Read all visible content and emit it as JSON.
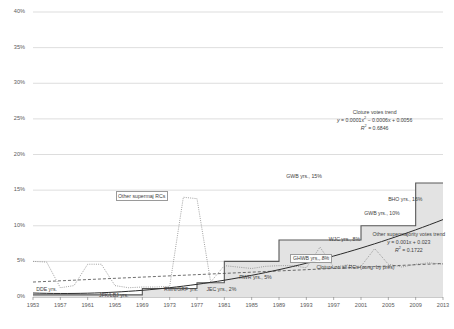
{
  "chart_data": {
    "type": "line",
    "title": "",
    "xlabel": "",
    "ylabel": "",
    "ylim": [
      0,
      0.4
    ],
    "xlim": [
      1953,
      2013
    ],
    "grid": true,
    "legend_position": "inline-annotations",
    "ytick_labels": [
      "40%",
      "35%",
      "30%",
      "25%",
      "20%",
      "15%",
      "10%",
      "5%",
      "0%"
    ],
    "ytick_values": [
      40,
      35,
      30,
      25,
      20,
      15,
      10,
      5,
      0
    ],
    "xtick_labels": [
      "1953",
      "1957",
      "1961",
      "1965",
      "1969",
      "1973",
      "1977",
      "1981",
      "1985",
      "1989",
      "1993",
      "1997",
      "2001",
      "2005",
      "2009",
      "2013"
    ],
    "xtick_values": [
      1953,
      1957,
      1961,
      1965,
      1969,
      1973,
      1977,
      1981,
      1985,
      1989,
      1993,
      1997,
      2001,
      2005,
      2009,
      2013
    ],
    "series": [
      {
        "name": "Cloture on all RCs (cong. by pres)",
        "style": "step-area",
        "color": "#585858",
        "fill": "#e3e3e3",
        "x": [
          1953,
          1961,
          1969,
          1977,
          1981,
          1989,
          1993,
          2001,
          2009,
          2013
        ],
        "values": [
          0.3,
          0.3,
          1.2,
          2.0,
          5.0,
          8.0,
          8.0,
          10.0,
          16.0,
          16.0
        ]
      },
      {
        "name": "Other supermaj RCs",
        "style": "dotted",
        "color": "#7a7a7a",
        "x": [
          1953,
          1955,
          1957,
          1959,
          1961,
          1963,
          1965,
          1967,
          1969,
          1971,
          1973,
          1975,
          1977,
          1979,
          1981,
          1983,
          1985,
          1987,
          1989,
          1991,
          1993,
          1995,
          1997,
          1999,
          2001,
          2003,
          2005,
          2007,
          2009,
          2011,
          2013
        ],
        "values": [
          5.0,
          4.9,
          1.3,
          1.6,
          4.6,
          4.6,
          1.6,
          1.3,
          1.4,
          1.4,
          1.5,
          14.0,
          13.8,
          2.1,
          4.4,
          4.2,
          4.0,
          4.3,
          4.4,
          4.4,
          4.1,
          7.0,
          4.2,
          4.5,
          4.3,
          6.8,
          4.6,
          4.2,
          4.6,
          4.8,
          4.6
        ]
      },
      {
        "name": "Other supermajority votes trend",
        "style": "dashed",
        "color": "#4a4a4a",
        "equation": "y = 0.001x + 0.023",
        "r2": "R² = 0.1722",
        "x": [
          1953,
          2013
        ],
        "values": [
          2.1,
          4.7
        ]
      },
      {
        "name": "Cloture votes trend",
        "style": "solid",
        "color": "#2b2b2b",
        "equation": "y = 0.0001x² − 0.0006x + 0.0056",
        "r2": "R² = 0.6846",
        "x": [
          1953,
          1973,
          1993,
          2013
        ],
        "values": [
          0.4,
          2.6,
          8.8,
          21.0
        ]
      }
    ],
    "annotations": [
      {
        "id": "doe",
        "text": "DDE yrs.",
        "x": 1956.4,
        "y": 1.0,
        "boxed": false
      },
      {
        "id": "jfk-lbj",
        "text": "JFK/LBJ yrs.",
        "x": 1965.6,
        "y": 0.2,
        "boxed": false
      },
      {
        "id": "rmn-grf",
        "text": "RMN/GRF yrs.",
        "x": 1975.1,
        "y": 1.0,
        "boxed": false
      },
      {
        "id": "jec",
        "text": "JEC yrs., 2%",
        "x": 1981.3,
        "y": 1.0,
        "boxed": false
      },
      {
        "id": "rwr",
        "text": "RWR yrs., 5%",
        "x": 1986.1,
        "y": 2.6,
        "boxed": false
      },
      {
        "id": "ghwb",
        "text": "GHWB yrs., 8%",
        "x": 1993.6,
        "y": 5.5,
        "boxed": true
      },
      {
        "id": "wjc",
        "text": "WJC yrs., 8%",
        "x": 1999.2,
        "y": 8.0,
        "boxed": false
      },
      {
        "id": "gwb-low",
        "text": "GWB yrs., 10%",
        "x": 2004.4,
        "y": 11.7,
        "boxed": false
      },
      {
        "id": "bho",
        "text": "BHO yrs., 16%",
        "x": 2007.9,
        "y": 13.6,
        "boxed": false
      },
      {
        "id": "gwb-high",
        "text": "GWB yrs., 15%",
        "x": 1993.0,
        "y": 16.9,
        "boxed": false
      },
      {
        "id": "other-supermaj-rcs",
        "text": "Other supermaj RCs",
        "x": 1968.0,
        "y": 14.3,
        "boxed": true
      },
      {
        "id": "cloture-all-rcs",
        "text": "Cloture on all RCs (cong. by pres)",
        "x": 1997.4,
        "y": 4.1,
        "boxed": false
      }
    ],
    "equation_blocks": [
      {
        "id": "cloture-votes-trend",
        "title": "Cloture votes trend",
        "line1_prefix": "y",
        "line1": " = 0.0001x",
        "line1_sup": "2",
        "line1_rest": " − 0.0006x + 0.0056",
        "line2_prefix": "R",
        "line2_sup": "2",
        "line2_rest": " = 0.6846",
        "x": 2003.0,
        "y": 25.6
      },
      {
        "id": "other-supermajority-votes-trend",
        "title": "Other supermajority votes trend",
        "line1_prefix": "y",
        "line1": " = 0.001x + 0.023",
        "line1_sup": "",
        "line1_rest": "",
        "line2_prefix": "R",
        "line2_sup": "2",
        "line2_rest": " = 0.1722",
        "x": 2008.0,
        "y": 8.4
      }
    ]
  }
}
